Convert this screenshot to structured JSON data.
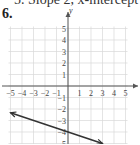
{
  "header": {
    "partial_text": "5. Slope 2, x-intercept (3"
  },
  "problem": {
    "number": "6."
  },
  "chart_data": {
    "type": "line",
    "title": "",
    "xlabel": "",
    "ylabel": "y",
    "xlim": [
      -5,
      5
    ],
    "ylim": [
      -5,
      5
    ],
    "grid": true,
    "x_ticks": [
      -5,
      -4,
      -3,
      -2,
      -1,
      1,
      2,
      3,
      4,
      5
    ],
    "y_ticks": [
      5,
      4,
      3,
      2,
      1,
      -1,
      -2,
      -3,
      -4,
      -5
    ],
    "series": [
      {
        "name": "line",
        "x": [
          -5,
          3
        ],
        "y": [
          -2.33,
          -5
        ],
        "slope": -0.333,
        "y_intercept": -4,
        "arrows": "both"
      }
    ],
    "colors": {
      "line": "#333333",
      "grid": "#d8d8d8",
      "axis": "#555555"
    }
  }
}
